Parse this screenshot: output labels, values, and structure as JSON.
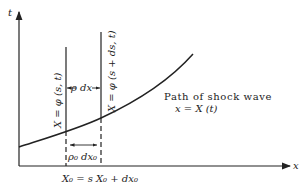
{
  "diagram": {
    "type": "space-time diagram",
    "axes": {
      "vertical_label": "t",
      "horizontal_label": "x"
    },
    "curve": {
      "label_line1": "Path of shock wave",
      "label_line2": "x = X (t)"
    },
    "particle_paths": [
      {
        "label": "X = φ (s, t)",
        "base_label": "X₀ = s"
      },
      {
        "label": "X = φ (s + ds, t)",
        "base_label": "X₀ + dx₀"
      }
    ],
    "spacing_labels": {
      "upper": "ρ dx",
      "lower": "ρ₀ dx₀"
    },
    "colors": {
      "ink": "#222222",
      "background": "#ffffff"
    }
  }
}
